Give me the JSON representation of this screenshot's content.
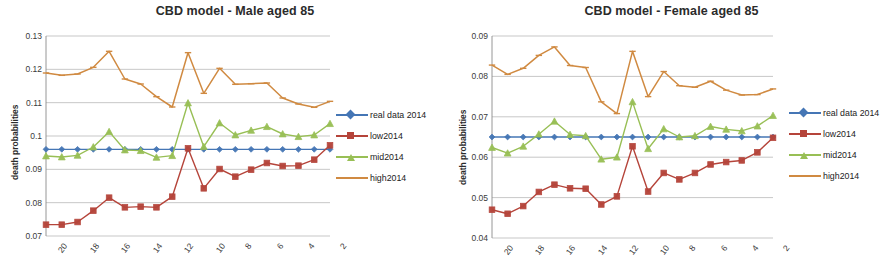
{
  "figure": {
    "panels": [
      {
        "id": "male",
        "title": "CBD model - Male aged 85",
        "ylabel": "death probabilities"
      },
      {
        "id": "female",
        "title": "CBD model - Female aged 85",
        "ylabel": "death probabilities"
      }
    ],
    "legend": {
      "entries": [
        {
          "label": "real data 2014",
          "color": "#4576b5",
          "marker": "diamond"
        },
        {
          "label": "low2014",
          "color": "#b5443a",
          "marker": "square"
        },
        {
          "label": "mid2014",
          "color": "#98bf55",
          "marker": "triangle"
        },
        {
          "label": "high2014",
          "color": "#d08a41",
          "marker": "none"
        }
      ]
    }
  },
  "chart_data": [
    {
      "type": "line",
      "title": "CBD model - Male aged 85",
      "xlabel": "",
      "ylabel": "death probabilities",
      "ylim": [
        0.07,
        0.13
      ],
      "yticks": [
        "0.07",
        "0.08",
        "0.09",
        "0.1",
        "0.11",
        "0.12",
        "0.13"
      ],
      "ytick_values": [
        0.07,
        0.08,
        0.09,
        0.1,
        0.11,
        0.12,
        0.13
      ],
      "grid": true,
      "legend_position": "right",
      "x": [
        20,
        19,
        18,
        17,
        16,
        15,
        14,
        13,
        12,
        11,
        10,
        9,
        8,
        7,
        6,
        5,
        4,
        3,
        2
      ],
      "xtick_labels": [
        "20",
        "18",
        "16",
        "14",
        "12",
        "10",
        "8",
        "6",
        "4",
        "2"
      ],
      "series": [
        {
          "name": "real data 2014",
          "color": "#4576b5",
          "marker": "diamond",
          "values": [
            0.096,
            0.096,
            0.096,
            0.096,
            0.096,
            0.096,
            0.096,
            0.096,
            0.096,
            0.096,
            0.096,
            0.096,
            0.096,
            0.096,
            0.096,
            0.096,
            0.096,
            0.096,
            0.096
          ]
        },
        {
          "name": "low2014",
          "color": "#b5443a",
          "marker": "square",
          "values": [
            0.0734,
            0.0734,
            0.0742,
            0.0776,
            0.0815,
            0.0786,
            0.0788,
            0.0786,
            0.0818,
            0.0963,
            0.0843,
            0.0901,
            0.0878,
            0.0899,
            0.0919,
            0.091,
            0.0911,
            0.0929,
            0.0972
          ]
        },
        {
          "name": "mid2014",
          "color": "#98bf55",
          "marker": "triangle",
          "values": [
            0.094,
            0.0937,
            0.0942,
            0.0967,
            0.1013,
            0.0958,
            0.0956,
            0.0936,
            0.0941,
            0.1099,
            0.0968,
            0.1039,
            0.1003,
            0.1017,
            0.1028,
            0.1006,
            0.0998,
            0.1003,
            0.1037
          ]
        },
        {
          "name": "high2014",
          "color": "#d08a41",
          "marker": "none",
          "values": [
            0.1189,
            0.1182,
            0.1186,
            0.1206,
            0.1254,
            0.1171,
            0.1156,
            0.1118,
            0.1087,
            0.125,
            0.1128,
            0.1203,
            0.1155,
            0.1157,
            0.1159,
            0.1114,
            0.1096,
            0.1086,
            0.1104
          ]
        }
      ]
    },
    {
      "type": "line",
      "title": "CBD model - Female aged 85",
      "xlabel": "",
      "ylabel": "death probabilities",
      "ylim": [
        0.04,
        0.09
      ],
      "yticks": [
        "0.04",
        "0.05",
        "0.06",
        "0.07",
        "0.08",
        "0.09"
      ],
      "ytick_values": [
        0.04,
        0.05,
        0.06,
        0.07,
        0.08,
        0.09
      ],
      "grid": true,
      "legend_position": "right",
      "x": [
        20,
        19,
        18,
        17,
        16,
        15,
        14,
        13,
        12,
        11,
        10,
        9,
        8,
        7,
        6,
        5,
        4,
        3,
        2
      ],
      "xtick_labels": [
        "20",
        "18",
        "16",
        "14",
        "12",
        "10",
        "8",
        "6",
        "4",
        "2"
      ],
      "series": [
        {
          "name": "real data 2014",
          "color": "#4576b5",
          "marker": "diamond",
          "values": [
            0.065,
            0.065,
            0.065,
            0.065,
            0.065,
            0.065,
            0.065,
            0.065,
            0.065,
            0.065,
            0.065,
            0.065,
            0.065,
            0.065,
            0.065,
            0.065,
            0.065,
            0.065,
            0.065
          ]
        },
        {
          "name": "low2014",
          "color": "#b5443a",
          "marker": "square",
          "values": [
            0.047,
            0.046,
            0.0479,
            0.0514,
            0.0532,
            0.0523,
            0.0522,
            0.0483,
            0.0503,
            0.0627,
            0.0515,
            0.0561,
            0.0545,
            0.0561,
            0.0582,
            0.0588,
            0.0592,
            0.0612,
            0.0648
          ]
        },
        {
          "name": "mid2014",
          "color": "#98bf55",
          "marker": "triangle",
          "values": [
            0.0624,
            0.061,
            0.0627,
            0.0657,
            0.0689,
            0.0656,
            0.0653,
            0.0595,
            0.06,
            0.0737,
            0.0621,
            0.067,
            0.065,
            0.0653,
            0.0676,
            0.0669,
            0.0665,
            0.0677,
            0.0703
          ]
        },
        {
          "name": "high2014",
          "color": "#d08a41",
          "marker": "none",
          "values": [
            0.0828,
            0.0805,
            0.082,
            0.0852,
            0.0873,
            0.0827,
            0.0822,
            0.0737,
            0.0708,
            0.0862,
            0.075,
            0.0812,
            0.0777,
            0.0773,
            0.0788,
            0.0766,
            0.0754,
            0.0755,
            0.0769
          ]
        }
      ]
    }
  ]
}
